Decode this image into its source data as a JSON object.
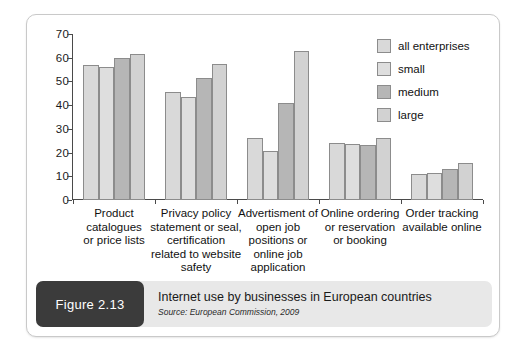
{
  "figure": {
    "tag": "Figure 2.13",
    "title": "Internet use by businesses in European countries",
    "source": "Source: European Commission, 2009"
  },
  "colors": {
    "series_all_enterprises": "#d9d9d9",
    "series_small": "#dedede",
    "series_medium": "#b6b6b6",
    "series_large": "#d2d2d2",
    "bar_border": "#8c8c8c",
    "axis": "#4a4a4a",
    "caption_bar": "#e8e8e8",
    "figure_tag": "#3b3b3b",
    "card_border": "#c9c9c9"
  },
  "chart_data": {
    "type": "bar",
    "title": "Internet use by businesses in European countries",
    "xlabel": "",
    "ylabel": "",
    "ylim": [
      0,
      70
    ],
    "yticks": [
      0,
      10,
      20,
      30,
      40,
      50,
      60,
      70
    ],
    "grid": false,
    "legend_position": "top-right",
    "categories": [
      "Product catalogues or price lists",
      "Privacy policy statement or seal, certification related to website safety",
      "Advertisment of open job positions or online job application",
      "Online ordering or reservation or booking",
      "Order tracking available online"
    ],
    "category_lines": [
      [
        "Product",
        "catalogues",
        "or price lists"
      ],
      [
        "Privacy policy",
        "statement or seal,",
        "certification",
        "related to website",
        "safety"
      ],
      [
        "Advertisment of",
        "open job",
        "positions or",
        "online job",
        "application"
      ],
      [
        "Online ordering",
        "or reservation",
        "or booking"
      ],
      [
        "Order tracking",
        "available online"
      ]
    ],
    "series": [
      {
        "name": "all enterprises",
        "color": "#d9d9d9",
        "values": [
          57,
          45.5,
          26,
          24,
          11
        ]
      },
      {
        "name": "small",
        "color": "#dedede",
        "values": [
          56,
          43.5,
          20.5,
          23.5,
          11.5
        ]
      },
      {
        "name": "medium",
        "color": "#b6b6b6",
        "values": [
          60,
          51.5,
          41,
          23,
          13
        ]
      },
      {
        "name": "large",
        "color": "#d2d2d2",
        "values": [
          61.5,
          57.5,
          63,
          26,
          15.5
        ]
      }
    ]
  }
}
